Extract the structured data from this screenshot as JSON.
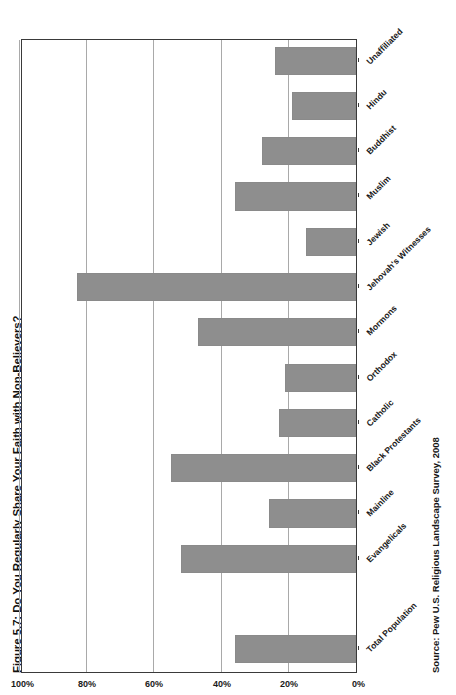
{
  "figure": {
    "title": "Figure 5.7: Do You Regularly Share Your Faith with Non-Believers?",
    "source": "Source: Pew U.S. Religious Landscape Survey, 2008",
    "bar_color": "#8e8e8e",
    "grid_color": "#a9a9a9",
    "axis_color": "#3a3a3a"
  },
  "chart_data": {
    "type": "bar",
    "orientation": "horizontal-rotated",
    "title": "Figure 5.7: Do You Regularly Share Your Faith with Non-Believers?",
    "xlabel": "",
    "ylabel": "",
    "ylim": [
      0,
      100
    ],
    "grid": true,
    "legend": false,
    "tick_labels": [
      "0%",
      "20%",
      "40%",
      "60%",
      "80%",
      "100%"
    ],
    "tick_values": [
      0,
      20,
      40,
      60,
      80,
      100
    ],
    "categories": [
      "Total Population",
      "Evangelicals",
      "Mainline",
      "Black Protestants",
      "Catholic",
      "Orthodox",
      "Mormons",
      "Jehovah's Witnesses",
      "Jewish",
      "Muslim",
      "Buddhist",
      "Hindu",
      "Unaffiliated"
    ],
    "values": [
      36,
      52,
      26,
      55,
      23,
      21,
      47,
      83,
      15,
      36,
      28,
      19,
      24
    ],
    "gaps_after": [
      0
    ]
  }
}
